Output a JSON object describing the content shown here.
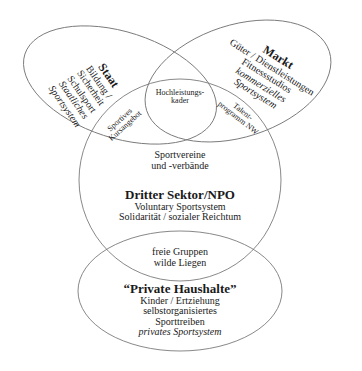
{
  "diagram": {
    "stroke_color": "#7a7a7a",
    "text_color": "#1a1a1a",
    "sets": {
      "staat": {
        "title": "Staat",
        "lines": [
          "Bildung /",
          "Sicherheit",
          "Schulsport"
        ],
        "italic_lines": [
          "Staatliches",
          "Sportsystem"
        ]
      },
      "markt": {
        "title": "Markt",
        "lines": [
          "Güter / Dienstleistungen",
          "Fitnessstudios"
        ],
        "italic_lines": [
          "kommerzielles",
          "Sportsystem"
        ]
      },
      "dritter_sektor": {
        "top_lines": [
          "Sportvereine",
          "und -verbände"
        ],
        "title": "Dritter Sektor/NPO",
        "lines": [
          "Voluntary Sportsystem",
          "Solidarität / sozialer Reichtum"
        ]
      },
      "private_haushalte": {
        "title": "“Private Haushalte”",
        "lines": [
          "Kinder / Ertziehung",
          "selbstorganisiertes",
          "Sporttreiben"
        ],
        "italic_lines": [
          "privates Sportsystem"
        ]
      }
    },
    "intersections": {
      "staat_markt_dritter": [
        "Hochleistungs-",
        "kader"
      ],
      "staat_dritter": [
        "Sportives",
        "Kursangebot"
      ],
      "markt_dritter": [
        "Talent-",
        "programm NW"
      ],
      "dritter_private": [
        "freie Gruppen",
        "wilde Liegen"
      ]
    }
  }
}
